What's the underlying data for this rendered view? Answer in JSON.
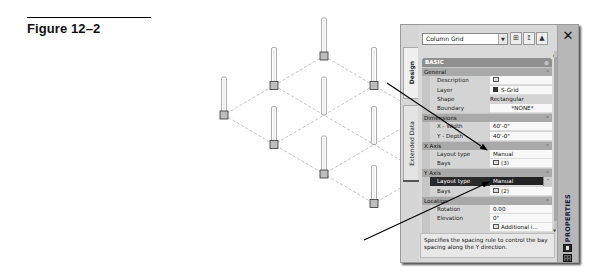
{
  "figure": {
    "caption": "Figure 12–2"
  },
  "palette": {
    "panel_bg": "#d9d9d9",
    "header_bg": "#8f8f8f",
    "category_bg": "#a9a9a9",
    "selected_bg": "#222222",
    "grid_line": "#888888",
    "column_stroke": "#777777"
  },
  "properties_palette": {
    "title": "PROPERTIES",
    "close_icon": "close-icon",
    "tabs": [
      {
        "label": "Design",
        "active": true
      },
      {
        "label": "Extended Data",
        "active": false
      }
    ],
    "object_selector": {
      "value": "Column Grid",
      "buttons": [
        "add-to-selection-icon",
        "quick-select-icon",
        "select-objects-icon"
      ]
    },
    "section_header": "BASIC",
    "categories": [
      {
        "label": "General",
        "rows": [
          {
            "name": "Description",
            "value": "",
            "icon": "text-editor-icon"
          },
          {
            "name": "Layer",
            "value": "S-Grid",
            "icon": "layer-swatch-icon"
          },
          {
            "name": "Shape",
            "value": "Rectangular"
          },
          {
            "name": "Boundary",
            "value": "*NONE*"
          }
        ]
      },
      {
        "label": "Dimensions",
        "rows": [
          {
            "name": "X - Width",
            "value": "60'-0\""
          },
          {
            "name": "Y - Depth",
            "value": "40'-0\""
          }
        ]
      },
      {
        "label": "X Axis",
        "rows": [
          {
            "name": "Layout type",
            "value": "Manual"
          },
          {
            "name": "Bays",
            "value": "(3)",
            "icon": "text-editor-icon"
          }
        ]
      },
      {
        "label": "Y Axis",
        "rows": [
          {
            "name": "Layout type",
            "value": "Manual",
            "selected": true
          },
          {
            "name": "Bays",
            "value": "(2)",
            "icon": "text-editor-icon"
          }
        ]
      },
      {
        "label": "Location",
        "rows": [
          {
            "name": "Rotation",
            "value": "0.00"
          },
          {
            "name": "Elevation",
            "value": "0\""
          },
          {
            "name": "",
            "value": "Additional i...",
            "icon": "text-editor-icon"
          }
        ]
      }
    ],
    "help_text": "Specifies the spacing rule to control the bay spacing along the Y direction."
  },
  "column_grid": {
    "x_bays": 3,
    "y_bays": 2,
    "columns_shown": 11
  }
}
